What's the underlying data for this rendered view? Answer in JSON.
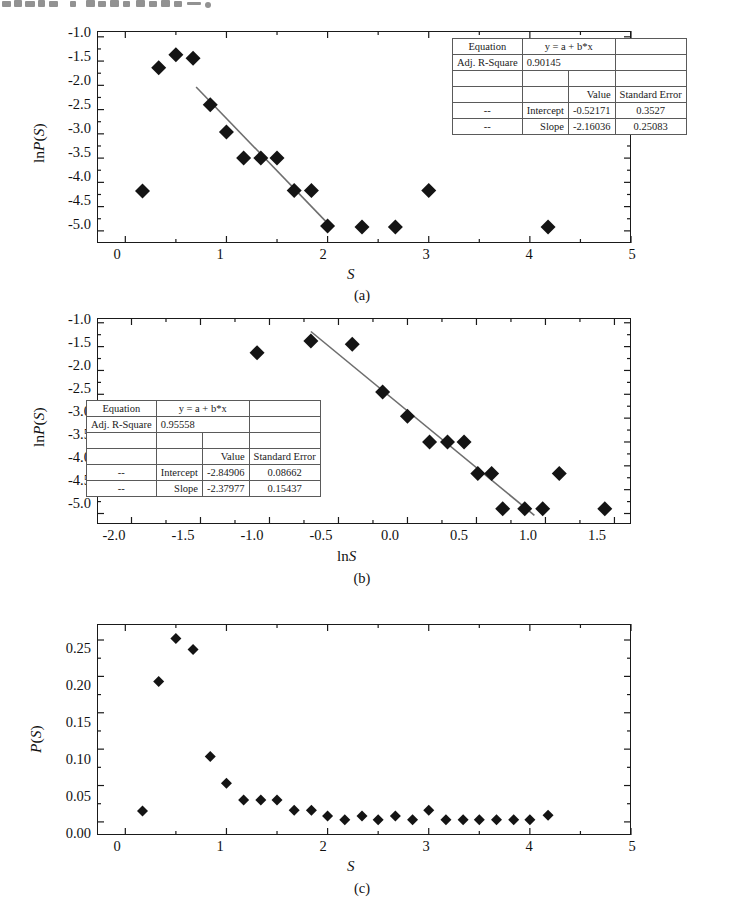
{
  "figure": {
    "top_partial_text": "scanned-chinese-text-cropped"
  },
  "panels": [
    {
      "id": "a",
      "caption": "(a)",
      "xlabel": "S",
      "ylabel": "lnP(S)",
      "ylabel_plain": "ln",
      "ylabel_italic": "P(S)",
      "xticks": [
        "0",
        "1",
        "2",
        "3",
        "4",
        "5"
      ],
      "yticks": [
        "-1.0",
        "-1.5",
        "-2.0",
        "-2.5",
        "-3.0",
        "-3.5",
        "-4.0",
        "-4.5",
        "-5.0"
      ],
      "table": {
        "rows": [
          [
            "Equation",
            "y = a + b*x",
            ""
          ],
          [
            "Adj. R-Square",
            "0.90145",
            ""
          ],
          [
            "",
            "",
            ""
          ],
          [
            "",
            "Value",
            "Standard Error"
          ],
          [
            "--",
            "Intercept",
            "-0.52171",
            "0.3527"
          ],
          [
            "--",
            "Slope",
            "-2.16036",
            "0.25083"
          ]
        ],
        "equation_label": "Equation",
        "equation_value": "y = a + b*x",
        "r2_label": "Adj. R-Square",
        "r2_value": "0.90145",
        "value_header": "Value",
        "error_header": "Standard Error",
        "intercept_label": "Intercept",
        "intercept_value": "-0.52171",
        "intercept_error": "0.3527",
        "slope_label": "Slope",
        "slope_value": "-2.16036",
        "slope_error": "0.25083",
        "dash": "--"
      }
    },
    {
      "id": "b",
      "caption": "(b)",
      "xlabel": "lnS",
      "ylabel": "lnP(S)",
      "xticks": [
        "-2.0",
        "-1.5",
        "-1.0",
        "-0.5",
        "0.0",
        "0.5",
        "1.0",
        "1.5"
      ],
      "yticks": [
        "-1.0",
        "-1.5",
        "-2.0",
        "-2.5",
        "-3.0",
        "-3.5",
        "-4.0",
        "-4.5",
        "-5.0"
      ],
      "table": {
        "equation_label": "Equation",
        "equation_value": "y = a + b*x",
        "r2_label": "Adj. R-Square",
        "r2_value": "0.95558",
        "value_header": "Value",
        "error_header": "Standard Error",
        "intercept_label": "Intercept",
        "intercept_value": "-2.84906",
        "intercept_error": "0.08662",
        "slope_label": "Slope",
        "slope_value": "-2.37977",
        "slope_error": "0.15437",
        "dash": "--"
      }
    },
    {
      "id": "c",
      "caption": "(c)",
      "xlabel": "S",
      "ylabel": "P(S)",
      "xticks": [
        "0",
        "1",
        "2",
        "3",
        "4",
        "5"
      ],
      "yticks": [
        "0.00",
        "0.05",
        "0.10",
        "0.15",
        "0.20",
        "0.25"
      ]
    }
  ],
  "chart_data": [
    {
      "type": "scatter",
      "panel": "a",
      "title": "",
      "xlabel": "S",
      "ylabel": "lnP(S)",
      "xlim": [
        -0.28,
        5.0
      ],
      "ylim": [
        -5.25,
        -0.88
      ],
      "grid": false,
      "legend": "none",
      "points": [
        {
          "x": 0.17,
          "y": -4.18
        },
        {
          "x": 0.33,
          "y": -1.64
        },
        {
          "x": 0.5,
          "y": -1.37
        },
        {
          "x": 0.67,
          "y": -1.44
        },
        {
          "x": 0.84,
          "y": -2.4
        },
        {
          "x": 1.0,
          "y": -2.96
        },
        {
          "x": 1.17,
          "y": -3.5
        },
        {
          "x": 1.34,
          "y": -3.5
        },
        {
          "x": 1.5,
          "y": -3.5
        },
        {
          "x": 1.67,
          "y": -4.17
        },
        {
          "x": 1.84,
          "y": -4.17
        },
        {
          "x": 2.0,
          "y": -4.9
        },
        {
          "x": 2.34,
          "y": -4.92
        },
        {
          "x": 2.67,
          "y": -4.92
        },
        {
          "x": 3.0,
          "y": -4.17
        },
        {
          "x": 4.18,
          "y": -4.92
        }
      ],
      "fit_line": {
        "label": "linear fit",
        "equation": "y = a + b*x",
        "intercept": -0.52171,
        "slope": -2.16036,
        "adj_r_square": 0.90145,
        "intercept_std_error": 0.3527,
        "slope_std_error": 0.25083,
        "x_start": 0.7,
        "x_end": 2.02
      }
    },
    {
      "type": "scatter",
      "panel": "b",
      "title": "",
      "xlabel": "lnS",
      "ylabel": "lnP(S)",
      "xlim": [
        -2.25,
        1.62
      ],
      "ylim": [
        -5.22,
        -0.9
      ],
      "grid": false,
      "legend": "none",
      "points": [
        {
          "x": -1.09,
          "y": -1.63
        },
        {
          "x": -0.7,
          "y": -1.38
        },
        {
          "x": -0.4,
          "y": -1.45
        },
        {
          "x": -0.18,
          "y": -2.45
        },
        {
          "x": 0.0,
          "y": -2.96
        },
        {
          "x": 0.16,
          "y": -3.5
        },
        {
          "x": 0.29,
          "y": -3.5
        },
        {
          "x": 0.41,
          "y": -3.5
        },
        {
          "x": 0.51,
          "y": -4.16
        },
        {
          "x": 0.61,
          "y": -4.16
        },
        {
          "x": 0.69,
          "y": -4.9
        },
        {
          "x": 0.85,
          "y": -4.9
        },
        {
          "x": 0.98,
          "y": -4.9
        },
        {
          "x": 1.1,
          "y": -4.16
        },
        {
          "x": 1.43,
          "y": -4.9
        }
      ],
      "fit_line": {
        "label": "linear fit",
        "equation": "y = a + b*x",
        "intercept": -2.84906,
        "slope": -2.37977,
        "adj_r_square": 0.95558,
        "intercept_std_error": 0.08662,
        "slope_std_error": 0.15437,
        "x_start": -0.7,
        "x_end": 0.92
      }
    },
    {
      "type": "scatter",
      "panel": "c",
      "title": "",
      "xlabel": "S",
      "ylabel": "P(S)",
      "xlim": [
        -0.28,
        5.0
      ],
      "ylim": [
        -0.018,
        0.272
      ],
      "grid": false,
      "legend": "none",
      "points": [
        {
          "x": 0.17,
          "y": 0.015
        },
        {
          "x": 0.33,
          "y": 0.193
        },
        {
          "x": 0.5,
          "y": 0.252
        },
        {
          "x": 0.67,
          "y": 0.237
        },
        {
          "x": 0.84,
          "y": 0.09
        },
        {
          "x": 1.0,
          "y": 0.053
        },
        {
          "x": 1.17,
          "y": 0.03
        },
        {
          "x": 1.34,
          "y": 0.03
        },
        {
          "x": 1.5,
          "y": 0.03
        },
        {
          "x": 1.67,
          "y": 0.016
        },
        {
          "x": 1.84,
          "y": 0.016
        },
        {
          "x": 2.0,
          "y": 0.008
        },
        {
          "x": 2.17,
          "y": 0.003
        },
        {
          "x": 2.34,
          "y": 0.008
        },
        {
          "x": 2.5,
          "y": 0.003
        },
        {
          "x": 2.67,
          "y": 0.008
        },
        {
          "x": 2.84,
          "y": 0.003
        },
        {
          "x": 3.0,
          "y": 0.016
        },
        {
          "x": 3.17,
          "y": 0.003
        },
        {
          "x": 3.34,
          "y": 0.003
        },
        {
          "x": 3.5,
          "y": 0.003
        },
        {
          "x": 3.67,
          "y": 0.003
        },
        {
          "x": 3.84,
          "y": 0.003
        },
        {
          "x": 4.0,
          "y": 0.003
        },
        {
          "x": 4.18,
          "y": 0.009
        }
      ]
    }
  ]
}
